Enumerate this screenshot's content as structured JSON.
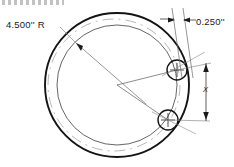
{
  "drawing": {
    "title": "Circular plate with two hole locations",
    "type": "engineering-dimensioned-drawing",
    "background_color": "#ffffff",
    "line_color": "#1a1a1a",
    "thin_line_color": "#555555",
    "centerline_color": "#8a8a8a",
    "annotations": {
      "radius_label": "4.500'' R",
      "thickness_label": "0.250''",
      "spacing_label": "X"
    },
    "geometry": {
      "outer_circle": {
        "cx": 117,
        "cy": 85,
        "r": 72,
        "stroke_width": 1.9
      },
      "inner_circle": {
        "cx": 117,
        "cy": 85,
        "r": 60,
        "stroke_width": 0.9
      },
      "centerline_circle": {
        "cx": 114,
        "cy": 85,
        "r": 66,
        "stroke_width": 0.7,
        "dash": "10 5"
      },
      "holes": [
        {
          "name": "upper-hole",
          "cx": 177,
          "cy": 70,
          "r": 10
        },
        {
          "name": "lower-hole",
          "cx": 168,
          "cy": 120,
          "r": 10
        }
      ],
      "center_point": {
        "x": 117,
        "y": 85
      }
    },
    "dimensions": [
      {
        "name": "wall-thickness",
        "value": "0.250''",
        "orientation": "horizontal-arrows",
        "arrow_y": 20
      },
      {
        "name": "hole-spacing",
        "value": "X",
        "orientation": "vertical-arrows",
        "line_x": 206,
        "top_y": 63,
        "bottom_y": 121
      },
      {
        "name": "plate-radius",
        "value": "4.500'' R",
        "orientation": "radial-leader",
        "arrow_tip": {
          "x": 76,
          "y": 43
        }
      }
    ]
  }
}
